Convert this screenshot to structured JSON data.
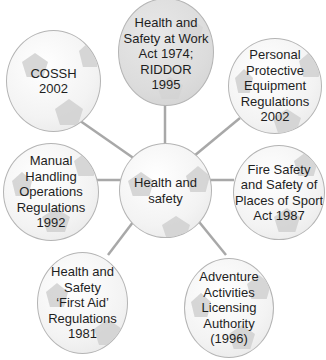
{
  "diagram": {
    "type": "spider-diagram",
    "center": {
      "label": "Health and\nsafety"
    },
    "nodes": [
      {
        "id": "cossh",
        "label": "COSSH\n2002"
      },
      {
        "id": "hswa",
        "label": "Health and\nSafety at Work\nAct 1974;\nRIDDOR\n1995"
      },
      {
        "id": "ppe",
        "label": "Personal\nProtective\nEquipment\nRegulations\n2002"
      },
      {
        "id": "manual",
        "label": "Manual\nHandling\nOperations\nRegulations\n1992"
      },
      {
        "id": "fire",
        "label": "Fire Safety\nand Safety of\nPlaces of Sport\nAct 1987"
      },
      {
        "id": "firstaid",
        "label": "Health and\nSafety\n‘First Aid’\nRegulations\n1981"
      },
      {
        "id": "adventure",
        "label": "Adventure\nActivities\nLicensing\nAuthority\n(1996)"
      }
    ],
    "colors": {
      "line": "#a8a8a8",
      "border": "#b4b4b4",
      "patch": "#d0d0d0",
      "text": "#1e1e1e"
    }
  }
}
